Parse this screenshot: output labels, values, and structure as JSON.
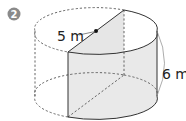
{
  "problem": {
    "number": "2",
    "badge_color": "#8a8a8a"
  },
  "figure": {
    "shape": "half-cylinder cut from cylinder",
    "radius_label": "5 m",
    "height_label": "6 m",
    "shaded_face_color": "#e4e4e4",
    "line_color": "#333333",
    "dashed_color": "#555555"
  }
}
